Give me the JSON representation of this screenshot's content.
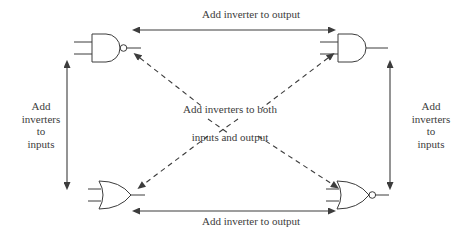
{
  "diagram": {
    "stroke_color": "#3c3c3c",
    "gates": [
      {
        "id": "nand",
        "name": "NAND gate",
        "position": "top-left",
        "shape": "and",
        "output_bubble": true,
        "inputs": 2
      },
      {
        "id": "and",
        "name": "AND gate",
        "position": "top-right",
        "shape": "and",
        "output_bubble": false,
        "inputs": 2
      },
      {
        "id": "or",
        "name": "OR gate",
        "position": "bottom-left",
        "shape": "or",
        "output_bubble": false,
        "inputs": 2
      },
      {
        "id": "nor",
        "name": "NOR gate",
        "position": "bottom-right",
        "shape": "or",
        "output_bubble": true,
        "inputs": 2
      }
    ],
    "arrows": [
      {
        "id": "top",
        "style": "solid",
        "heads": "both",
        "label": "Add inverter to output"
      },
      {
        "id": "bottom",
        "style": "solid",
        "heads": "both",
        "label": "Add inverter to output"
      },
      {
        "id": "left",
        "style": "solid",
        "heads": "both",
        "label": "Add inverters to inputs"
      },
      {
        "id": "right",
        "style": "solid",
        "heads": "both",
        "label": "Add inverters to inputs"
      },
      {
        "id": "diagonal-nw-se",
        "style": "dashed",
        "heads": "both",
        "label": "Add inverters to both inputs and output"
      },
      {
        "id": "diagonal-ne-sw",
        "style": "dashed",
        "heads": "both",
        "label": "Add inverters to both inputs and output"
      }
    ],
    "labels": {
      "top": "Add inverter to output",
      "bottom": "Add inverter to output",
      "center_line1": "Add inverters to both",
      "center_line2": "inputs and output",
      "left": "Add\ninverters\nto\ninputs",
      "right": "Add\ninverters\nto\ninputs"
    }
  }
}
